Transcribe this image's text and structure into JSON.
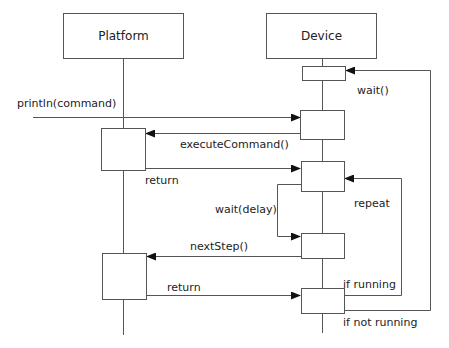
{
  "diagram": {
    "type": "sequence",
    "participants": [
      {
        "id": "platform",
        "label": "Platform"
      },
      {
        "id": "device",
        "label": "Device"
      }
    ],
    "messages": {
      "println": "println(command)",
      "execute_command": "executeCommand()",
      "return_1": "return",
      "wait": "wait()",
      "wait_delay": "wait(delay)",
      "repeat": "repeat",
      "next_step": "nextStep()",
      "return_2": "return",
      "if_running": "if running",
      "if_not_running": "if not running"
    },
    "colors": {
      "line": "#555555",
      "box_border": "#555555",
      "text": "#222222",
      "background": "#ffffff"
    }
  }
}
